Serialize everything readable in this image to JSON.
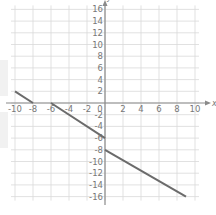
{
  "chart_data": {
    "type": "line",
    "title": "",
    "xlabel": "x",
    "ylabel": "y",
    "xlim": [
      -10,
      10
    ],
    "ylim": [
      -16,
      16
    ],
    "x_ticks": [
      -10,
      -8,
      -6,
      -4,
      -2,
      0,
      2,
      4,
      6,
      8,
      10
    ],
    "x_tick_labels": [
      "-10",
      "-8",
      "-6",
      "-4",
      "-2",
      "0",
      "2",
      "4",
      "6",
      "8",
      "10"
    ],
    "y_ticks": [
      16,
      14,
      12,
      10,
      8,
      6,
      4,
      2,
      -2,
      -4,
      -6,
      -8,
      -10,
      -12,
      -14,
      -16
    ],
    "y_tick_labels": [
      "16",
      "14",
      "12",
      "10",
      "8",
      "6",
      "4",
      "2",
      "-2",
      "-4",
      "-6",
      "-8",
      "-10",
      "-12",
      "-14",
      "-16"
    ],
    "grid": true,
    "series": [
      {
        "name": "segment-1",
        "x": [
          -10,
          -8
        ],
        "y": [
          2,
          0
        ]
      },
      {
        "name": "segment-2",
        "x": [
          -6,
          0
        ],
        "y": [
          0,
          -6
        ]
      },
      {
        "name": "segment-3",
        "x": [
          0,
          9
        ],
        "y": [
          -8,
          -16
        ]
      }
    ],
    "colors": {
      "line": "#6b6b6b",
      "grid": "#d9d9d9",
      "axis": "#8a8a8a",
      "text": "#777777"
    }
  }
}
